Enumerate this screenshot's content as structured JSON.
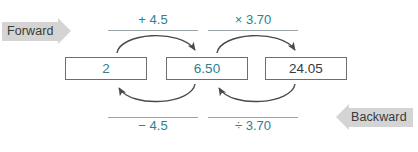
{
  "diagram": {
    "banners": {
      "forward": "Forward",
      "backward": "Backward"
    },
    "boxes": [
      {
        "value": "2",
        "color": "#2e7f93"
      },
      {
        "value": "6.50",
        "color": "#2e7f93"
      },
      {
        "value": "24.05",
        "color": "#39393b"
      }
    ],
    "forward_ops": [
      {
        "label": "+ 4.5"
      },
      {
        "label": "× 3.70"
      }
    ],
    "backward_ops": [
      {
        "label": "− 4.5"
      },
      {
        "label": "÷ 3.70"
      }
    ],
    "colors": {
      "accent": "#2e7f93",
      "box_border": "#6b6f72",
      "rule": "#9aa3a8",
      "banner": "#d4d4d4",
      "arrow": "#4a4a4a",
      "background": "#ffffff"
    }
  }
}
